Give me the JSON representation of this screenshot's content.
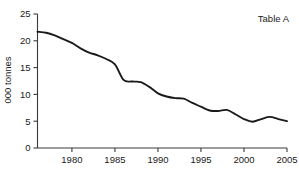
{
  "chart_data": {
    "type": "line",
    "title": "Table A",
    "xlabel": "",
    "ylabel": "000 tonnes",
    "xlim": [
      1976,
      2005
    ],
    "ylim": [
      0,
      25
    ],
    "grid": false,
    "legend": null,
    "x_ticks": [
      "1980",
      "1985",
      "1990",
      "1995",
      "2000",
      "2005"
    ],
    "x_tick_values": [
      1980,
      1985,
      1990,
      1995,
      2000,
      2005
    ],
    "y_ticks": [
      "0",
      "5",
      "10",
      "15",
      "20",
      "25"
    ],
    "y_tick_values": [
      0,
      5,
      10,
      15,
      20,
      25
    ],
    "series": [
      {
        "name": "tonnes",
        "x": [
          1976,
          1977,
          1978,
          1979,
          1980,
          1981,
          1982,
          1983,
          1984,
          1985,
          1986,
          1987,
          1988,
          1989,
          1990,
          1991,
          1992,
          1993,
          1994,
          1995,
          1996,
          1997,
          1998,
          1999,
          2000,
          2001,
          2002,
          2003,
          2004,
          2005
        ],
        "values": [
          21.7,
          21.5,
          21.0,
          20.3,
          19.6,
          18.6,
          17.8,
          17.3,
          16.6,
          15.6,
          12.7,
          12.4,
          12.3,
          11.4,
          10.2,
          9.6,
          9.3,
          9.2,
          8.4,
          7.7,
          7.0,
          6.9,
          7.1,
          6.3,
          5.4,
          4.9,
          5.4,
          5.8,
          5.4,
          5.0
        ]
      }
    ]
  },
  "axes": {
    "y_axis_title": "000 tonnes",
    "chart_title": "Table A"
  }
}
